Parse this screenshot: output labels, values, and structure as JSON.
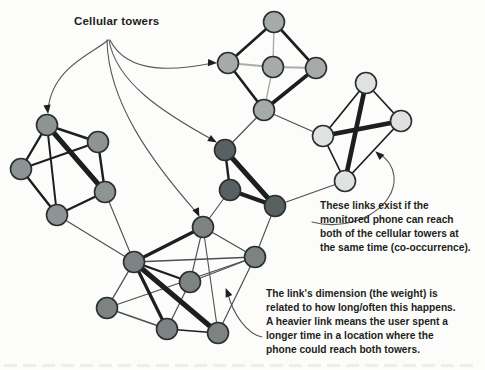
{
  "figure_label": "Cellular towers",
  "annotations": {
    "cooccurrence": {
      "lines": [
        "These links exist if the",
        "monitored phone can reach",
        "both of the cellular towers at",
        "the same time (co-occurrence)."
      ]
    },
    "weight": {
      "lines": [
        "The link's dimension (the weight) is",
        "related to how long/often this happens.",
        "A heavier link means the user spent a",
        "longer time in a location where the",
        "phone could reach both towers."
      ]
    }
  },
  "colors": {
    "background": "#fcfcfa",
    "text": "#1d1f20",
    "node_stroke": "#2b2f30",
    "pointer": "#55595a",
    "pointer_arrow": "#1d1f20",
    "clusters": {
      "left": "#8e9493",
      "top": "#a6aaa9",
      "dark": "#596061",
      "light": "#e0e2e0",
      "bottom": "#7d8382"
    },
    "edge_tones": {
      "d": "#1c1e1f",
      "m": "#4b4f50",
      "l": "#a9adab"
    }
  },
  "graph": {
    "node_radius": 10.5,
    "nodes": [
      {
        "id": "LA",
        "c": "left",
        "x": 47,
        "y": 125
      },
      {
        "id": "LB",
        "c": "left",
        "x": 98,
        "y": 142
      },
      {
        "id": "LC",
        "c": "left",
        "x": 21,
        "y": 169
      },
      {
        "id": "LD",
        "c": "left",
        "x": 105,
        "y": 192
      },
      {
        "id": "LE",
        "c": "left",
        "x": 57,
        "y": 215
      },
      {
        "id": "TA",
        "c": "top",
        "x": 274,
        "y": 22
      },
      {
        "id": "TB",
        "c": "top",
        "x": 228,
        "y": 63
      },
      {
        "id": "TC",
        "c": "top",
        "x": 273,
        "y": 67
      },
      {
        "id": "TD",
        "c": "top",
        "x": 316,
        "y": 68
      },
      {
        "id": "TE",
        "c": "top",
        "x": 264,
        "y": 110
      },
      {
        "id": "DA",
        "c": "dark",
        "x": 225,
        "y": 150
      },
      {
        "id": "DB",
        "c": "dark",
        "x": 230,
        "y": 190
      },
      {
        "id": "DC",
        "c": "dark",
        "x": 275,
        "y": 206
      },
      {
        "id": "GA",
        "c": "light",
        "x": 366,
        "y": 83
      },
      {
        "id": "GB",
        "c": "light",
        "x": 401,
        "y": 121
      },
      {
        "id": "GC",
        "c": "light",
        "x": 323,
        "y": 136
      },
      {
        "id": "GD",
        "c": "light",
        "x": 345,
        "y": 181
      },
      {
        "id": "BT",
        "c": "bottom",
        "x": 203,
        "y": 227
      },
      {
        "id": "BH",
        "c": "bottom",
        "x": 134,
        "y": 262
      },
      {
        "id": "BM",
        "c": "bottom",
        "x": 190,
        "y": 282
      },
      {
        "id": "BR",
        "c": "bottom",
        "x": 255,
        "y": 257
      },
      {
        "id": "BL",
        "c": "bottom",
        "x": 107,
        "y": 308
      },
      {
        "id": "B1",
        "c": "bottom",
        "x": 167,
        "y": 329
      },
      {
        "id": "B2",
        "c": "bottom",
        "x": 218,
        "y": 333
      }
    ],
    "edges": [
      [
        "LE",
        "BH",
        1.1,
        "m"
      ],
      [
        "LD",
        "BH",
        1.1,
        "m"
      ],
      [
        "TE",
        "DA",
        1.1,
        "m"
      ],
      [
        "TE",
        "GC",
        1.1,
        "m"
      ],
      [
        "DC",
        "GD",
        1.1,
        "m"
      ],
      [
        "DB",
        "BT",
        1.1,
        "m"
      ],
      [
        "DC",
        "BR",
        1.1,
        "m"
      ],
      [
        "LA",
        "LB",
        2.4,
        "d"
      ],
      [
        "LA",
        "LC",
        2.4,
        "d"
      ],
      [
        "LC",
        "LE",
        2.4,
        "d"
      ],
      [
        "LD",
        "LE",
        2.4,
        "d"
      ],
      [
        "LB",
        "LD",
        2.4,
        "d"
      ],
      [
        "LB",
        "LC",
        2.0,
        "d"
      ],
      [
        "LA",
        "LE",
        2.0,
        "d"
      ],
      [
        "LA",
        "LD",
        5.0,
        "d"
      ],
      [
        "TA",
        "TC",
        1.4,
        "l"
      ],
      [
        "TB",
        "TC",
        2.0,
        "l"
      ],
      [
        "TC",
        "TD",
        2.0,
        "l"
      ],
      [
        "TC",
        "TE",
        1.4,
        "l"
      ],
      [
        "TA",
        "TB",
        2.6,
        "d"
      ],
      [
        "TA",
        "TD",
        2.6,
        "d"
      ],
      [
        "TB",
        "TE",
        2.6,
        "d"
      ],
      [
        "TD",
        "TE",
        3.6,
        "d"
      ],
      [
        "DA",
        "DB",
        2.4,
        "d"
      ],
      [
        "DA",
        "DC",
        5.0,
        "d"
      ],
      [
        "DB",
        "DC",
        4.2,
        "d"
      ],
      [
        "GA",
        "GB",
        1.7,
        "d"
      ],
      [
        "GA",
        "GC",
        1.7,
        "d"
      ],
      [
        "GC",
        "GD",
        1.7,
        "d"
      ],
      [
        "GB",
        "GD",
        1.7,
        "d"
      ],
      [
        "GA",
        "GD",
        4.6,
        "d"
      ],
      [
        "GB",
        "GC",
        4.6,
        "d"
      ],
      [
        "BT",
        "BR",
        1.3,
        "m"
      ],
      [
        "BT",
        "BM",
        1.1,
        "m"
      ],
      [
        "BT",
        "B2",
        1.1,
        "m"
      ],
      [
        "BM",
        "BR",
        1.2,
        "m"
      ],
      [
        "BL",
        "BR",
        1.2,
        "m"
      ],
      [
        "BM",
        "B1",
        1.2,
        "m"
      ],
      [
        "BR",
        "B2",
        1.2,
        "m"
      ],
      [
        "BH",
        "BR",
        1.3,
        "m"
      ],
      [
        "BH",
        "BL",
        1.4,
        "m"
      ],
      [
        "BL",
        "B1",
        1.4,
        "m"
      ],
      [
        "B1",
        "B2",
        1.6,
        "d"
      ],
      [
        "BH",
        "BT",
        3.2,
        "d"
      ],
      [
        "BH",
        "BM",
        2.3,
        "d"
      ],
      [
        "BH",
        "B1",
        3.2,
        "d"
      ],
      [
        "BH",
        "B2",
        5.2,
        "d"
      ]
    ],
    "tower_pointers": [
      {
        "path": "M108,40 C96,52 52,66 48,110",
        "tip": [
          48,
          113
        ],
        "dir": 83
      },
      {
        "path": "M110,40 C128,76 178,70 213,63",
        "tip": [
          216,
          63
        ],
        "dir": 3
      },
      {
        "path": "M109,40 C116,82 162,112 213,140",
        "tip": [
          216,
          142
        ],
        "dir": 30
      },
      {
        "path": "M107,40 C108,102 152,162 197,213",
        "tip": [
          199,
          216
        ],
        "dir": 65
      }
    ],
    "leader_pointers": [
      {
        "path": "M312,222 C354,233 397,207 394,176 C392,163 385,157 379,154",
        "tip": [
          376,
          152
        ],
        "dir": 222
      },
      {
        "path": "M262,337 C247,334 233,314 228,294",
        "tip": [
          226,
          289
        ],
        "dir": 248
      }
    ]
  }
}
